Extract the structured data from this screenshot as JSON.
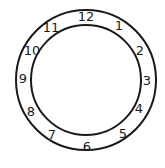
{
  "diagram": {
    "type": "clock-face",
    "stroke_color": "#1a1a1a",
    "background_color": "#ffffff",
    "center": [
      86,
      80
    ],
    "outer_radius": 70,
    "inner_radius": 55,
    "numbers": [
      {
        "label": "12",
        "x": 86,
        "y": 21
      },
      {
        "label": "1",
        "x": 119,
        "y": 30
      },
      {
        "label": "2",
        "x": 140,
        "y": 55
      },
      {
        "label": "3",
        "x": 147,
        "y": 85
      },
      {
        "label": "4",
        "x": 139,
        "y": 113
      },
      {
        "label": "5",
        "x": 123,
        "y": 138
      },
      {
        "label": "6",
        "x": 87,
        "y": 151
      },
      {
        "label": "7",
        "x": 52,
        "y": 139
      },
      {
        "label": "8",
        "x": 31,
        "y": 116
      },
      {
        "label": "9",
        "x": 23,
        "y": 83
      },
      {
        "label": "10",
        "x": 32,
        "y": 55
      },
      {
        "label": "11",
        "x": 51,
        "y": 32
      }
    ]
  }
}
